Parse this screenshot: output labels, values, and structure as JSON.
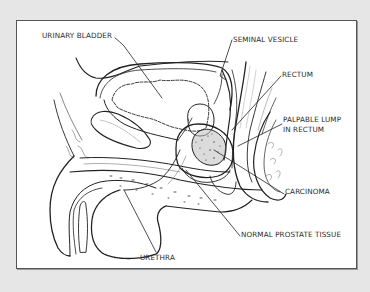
{
  "figure": {
    "title": "",
    "labels": {
      "urinary_bladder": "URINARY BLADDER",
      "seminal_vesicle": "SEMINAL VESICLE",
      "rectum": "RECTUM",
      "palpable_lump_line1": "PALPABLE LUMP",
      "palpable_lump_line2": "IN RECTUM",
      "carcinoma": "CARCINOMA",
      "normal_prostate_tissue": "NORMAL PROSTATE TISSUE",
      "urethra": "URETHRA"
    },
    "colors": {
      "background": "#e6e6e6",
      "panel": "#ffffff",
      "ink": "#222222"
    }
  }
}
